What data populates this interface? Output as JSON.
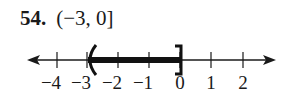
{
  "problem": {
    "number": "54.",
    "interval": "(−3, 0]"
  },
  "number_line": {
    "ticks": [
      {
        "value": -4,
        "label": "−4",
        "x": 57
      },
      {
        "value": -3,
        "label": "−3",
        "x": 87
      },
      {
        "value": -2,
        "label": "−2",
        "x": 118
      },
      {
        "value": -1,
        "label": "−1",
        "x": 149
      },
      {
        "value": 0,
        "label": "0",
        "x": 180
      },
      {
        "value": 1,
        "label": "1",
        "x": 211
      },
      {
        "value": 2,
        "label": "2",
        "x": 243
      }
    ],
    "shaded_interval": {
      "start": -3,
      "end": 0,
      "left_endpoint": "open",
      "right_endpoint": "closed",
      "left_symbol": "(",
      "right_symbol": "]"
    },
    "colors": {
      "line": "#1a1a1a",
      "shade": "#111111"
    }
  }
}
